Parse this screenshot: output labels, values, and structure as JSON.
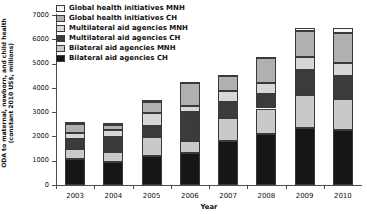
{
  "chart_data": {
    "type": "bar",
    "stacked": true,
    "title": "",
    "xlabel": "Year",
    "ylabel": "ODA to maternal, newborn, and child health (constant 2010 US$, millions)",
    "ylabel_lines": [
      "ODA to maternal, newborn, and child health",
      "(constant 2010 US$, millions)"
    ],
    "categories": [
      "2003",
      "2004",
      "2005",
      "2006",
      "2007",
      "2008",
      "2009",
      "2010"
    ],
    "ylim": [
      0,
      7000
    ],
    "yticks": [
      0,
      1000,
      2000,
      3000,
      4000,
      5000,
      6000,
      7000
    ],
    "ytick_labels": [
      "0",
      "1000",
      "2000",
      "3000",
      "4000",
      "5000",
      "6000",
      "7000"
    ],
    "grid": false,
    "legend_position": "top-left",
    "series": [
      {
        "name": "Bilateral aid agencies CH",
        "color": "#161616",
        "values": [
          1080,
          960,
          1200,
          1330,
          1810,
          2120,
          2340,
          2250
        ]
      },
      {
        "name": "Bilateral aid agencies MNH",
        "color": "#c9c9c9",
        "values": [
          420,
          390,
          760,
          500,
          960,
          1030,
          1370,
          1290
        ]
      },
      {
        "name": "Multilateral aid agencies CH",
        "color": "#3b3b3b",
        "values": [
          390,
          640,
          480,
          1160,
          650,
          580,
          1040,
          950
        ]
      },
      {
        "name": "Multilateral aid agencies MNH",
        "color": "#d7d7d7",
        "values": [
          270,
          260,
          540,
          250,
          450,
          470,
          510,
          520
        ]
      },
      {
        "name": "Global health initiatives CH",
        "color": "#b0b0b0",
        "values": [
          340,
          230,
          450,
          940,
          600,
          1010,
          1070,
          1240
        ]
      },
      {
        "name": "Global health initiatives MNH",
        "color": "#f7f7f7",
        "values": [
          80,
          80,
          70,
          70,
          80,
          70,
          150,
          200
        ]
      }
    ],
    "totals": [
      2580,
      2560,
      3500,
      4250,
      4550,
      5280,
      6480,
      6450
    ],
    "legend_order_top_to_bottom": [
      "Global health initiatives MNH",
      "Global health initiatives CH",
      "Multilateral aid agencies MNH",
      "Multilateral aid agencies CH",
      "Bilateral aid agencies MNH",
      "Bilateral aid agencies CH"
    ]
  }
}
